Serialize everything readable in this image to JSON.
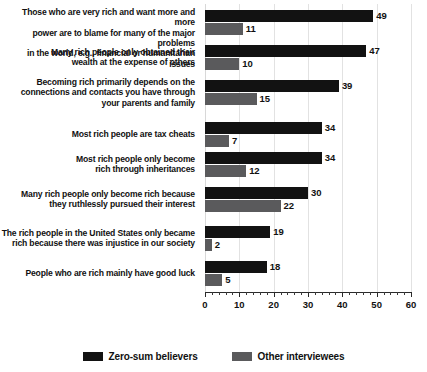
{
  "chart_data": {
    "type": "bar",
    "orientation": "horizontal",
    "title": "",
    "xlabel": "",
    "ylabel": "",
    "xlim": [
      0,
      60
    ],
    "xticks": [
      0,
      10,
      20,
      30,
      40,
      50,
      60
    ],
    "xtick_labels": [
      "0",
      "10",
      "20",
      "30",
      "40",
      "50",
      "60"
    ],
    "grid": true,
    "grid_axis": "x",
    "legend_position": "bottom-center",
    "categories": [
      "Those who are very rich and want more and more power are to blame for many of the major problems in the world, e.g., financial or humanitarian issues",
      "Many rich people only obtained their wealth at the expense of others",
      "Becoming rich primarily depends on the connections and contacts you have through your parents and family",
      "Most rich people are tax cheats",
      "Most rich people only become rich through inheritances",
      "Many rich people only become rich because they ruthlessly pursued their interest",
      "The rich people in the United States only became rich because there was injustice in our society",
      "People who are rich mainly have good luck"
    ],
    "category_lines": [
      [
        "Those who are very rich and want more and more",
        "power are to blame for many of the major problems",
        "in the world, e.g., financial or humanitarian issues"
      ],
      [
        "Many rich people only obtained their",
        "wealth at the expense of others"
      ],
      [
        "Becoming rich primarily depends on the",
        "connections and contacts you have through",
        "your parents and family"
      ],
      [
        "Most rich people are tax cheats"
      ],
      [
        "Most rich people only become",
        "rich through inheritances"
      ],
      [
        "Many rich people only become rich because",
        "they ruthlessly pursued their interest"
      ],
      [
        "The rich people in the United States only became",
        "rich because there was injustice in our society"
      ],
      [
        "People who are rich mainly have good luck"
      ]
    ],
    "series": [
      {
        "name": "Zero-sum believers",
        "color": "#121212",
        "values": [
          49,
          47,
          39,
          34,
          34,
          30,
          19,
          18
        ]
      },
      {
        "name": "Other interviewees",
        "color": "#5a5a5c",
        "values": [
          11,
          10,
          15,
          7,
          12,
          22,
          2,
          5
        ]
      }
    ]
  },
  "legend": {
    "items": [
      {
        "label": "Zero-sum believers",
        "color": "#121212"
      },
      {
        "label": "Other interviewees",
        "color": "#5a5a5c"
      }
    ]
  },
  "footnote": {
    "text": ""
  }
}
